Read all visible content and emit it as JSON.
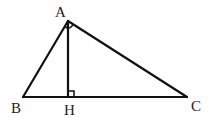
{
  "diagram": {
    "type": "right triangle with altitude",
    "labels": {
      "A": "A",
      "B": "B",
      "C": "C",
      "H": "H"
    },
    "stroke_color": "#111111",
    "background": "#ffffff",
    "points": {
      "A": [
        68,
        21
      ],
      "B": [
        23,
        97
      ],
      "C": [
        187,
        97
      ],
      "H": [
        68,
        97
      ]
    },
    "segments": [
      "AB",
      "AC",
      "BC",
      "AH"
    ],
    "right_angle_marks": [
      "A",
      "H"
    ]
  }
}
